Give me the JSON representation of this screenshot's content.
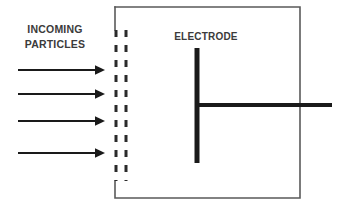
{
  "figure": {
    "type": "schematic-diagram",
    "width": 342,
    "height": 212,
    "background_color": "#ffffff"
  },
  "labels": {
    "incoming_particles_line1": "INCOMING",
    "incoming_particles_line2": "PARTICLES",
    "electrode": "ELECTRODE"
  },
  "colors": {
    "text": "#3b3b3b",
    "arrow": "#1a1a1a",
    "electrode": "#1a1a1a",
    "chamber_outline": "#5a5a5a",
    "grid_dashes": "#2b2b2b"
  },
  "geometry": {
    "arrows": {
      "count": 4,
      "x_start": 18,
      "x_end": 105,
      "y_positions": [
        70,
        94,
        121,
        153
      ],
      "stroke_width": 2.2,
      "head_length": 9,
      "head_width": 9,
      "direction": "right"
    },
    "grid_dashes": {
      "count": 2,
      "x_positions": [
        116,
        126
      ],
      "y_start": 30,
      "y_end": 181,
      "stroke_width": 3,
      "dash_on": 7,
      "dash_off": 8
    },
    "chamber": {
      "left": 115,
      "top": 7,
      "right": 300,
      "bottom": 198,
      "stroke_width": 1.6
    },
    "electrode_stem": {
      "x": 197,
      "y_top": 48,
      "y_bottom": 163,
      "stroke_width": 5
    },
    "electrode_lead": {
      "y": 105,
      "x_start": 196,
      "x_end": 332,
      "stroke_width": 4
    }
  }
}
